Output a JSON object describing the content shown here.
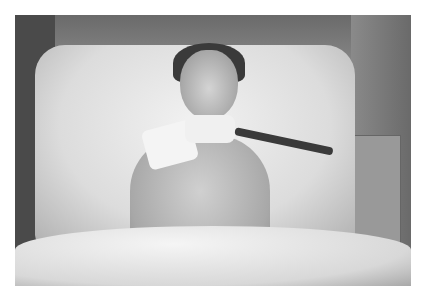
{
  "image": {
    "description": "Black-and-white photograph of a young patient lying in a hospital bed with a neck collar, tracheostomy tube, ECG leads and IV lines",
    "colors": {
      "background": "#ffffff",
      "dark": "#3a3a3a",
      "mid": "#8a8a8a",
      "light": "#f0f0f0"
    }
  }
}
